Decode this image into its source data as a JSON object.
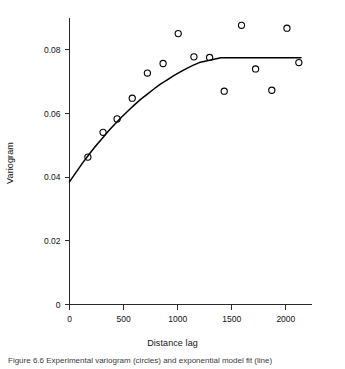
{
  "figure": {
    "caption_fragment": "Figure 6.6  Experimental variogram (circles) and exponential model fit (line)"
  },
  "chart_data": {
    "type": "scatter",
    "title": "",
    "xlabel": "Distance lag",
    "ylabel": "Variogram",
    "xlim": [
      0,
      2200
    ],
    "ylim": [
      0,
      0.09
    ],
    "xticks": [
      0,
      500,
      1000,
      1500,
      2000
    ],
    "xtick_labels": [
      "0",
      "500",
      "1000",
      "1500",
      "2000"
    ],
    "yticks": [
      0,
      0.02,
      0.04,
      0.06,
      0.08
    ],
    "ytick_labels": [
      "0",
      "0.02",
      "0.04",
      "0.06",
      "0.08"
    ],
    "grid": false,
    "legend": "none",
    "marker": "open-circle",
    "series": [
      {
        "name": "Experimental variogram",
        "type": "scatter",
        "x": [
          170,
          310,
          440,
          580,
          720,
          865,
          1005,
          1150,
          1295,
          1430,
          1590,
          1720,
          1870,
          2010,
          2120
        ],
        "y": [
          0.0463,
          0.0541,
          0.0583,
          0.0648,
          0.0727,
          0.0757,
          0.0851,
          0.0778,
          0.0776,
          0.067,
          0.0877,
          0.074,
          0.0673,
          0.0868,
          0.076
        ]
      },
      {
        "name": "Exponential model",
        "type": "line",
        "nugget": 0.0385,
        "sill": 0.0775,
        "range": 1150,
        "x": [
          0,
          60,
          120,
          180,
          240,
          300,
          360,
          420,
          480,
          540,
          600,
          660,
          720,
          780,
          840,
          900,
          960,
          1020,
          1080,
          1140,
          1200,
          1400,
          1600,
          1800,
          2000,
          2140
        ],
        "y": [
          0.0385,
          0.0415,
          0.0444,
          0.0471,
          0.0497,
          0.0521,
          0.0545,
          0.0567,
          0.0588,
          0.0608,
          0.0627,
          0.0645,
          0.0661,
          0.0677,
          0.0692,
          0.0705,
          0.0718,
          0.073,
          0.0741,
          0.0751,
          0.076,
          0.0775,
          0.0775,
          0.0775,
          0.0775,
          0.0775
        ]
      }
    ]
  }
}
